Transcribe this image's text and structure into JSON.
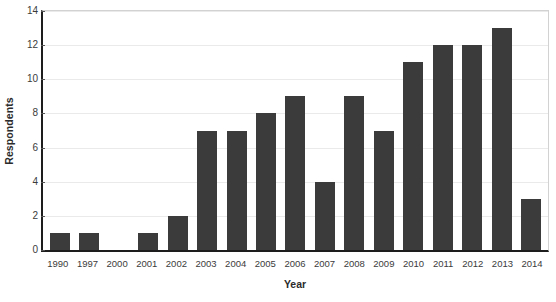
{
  "chart_data": {
    "type": "bar",
    "title": "",
    "xlabel": "Year",
    "ylabel": "Respondents",
    "categories": [
      "1990",
      "1997",
      "2000",
      "2001",
      "2002",
      "2003",
      "2004",
      "2005",
      "2006",
      "2007",
      "2008",
      "2009",
      "2010",
      "2011",
      "2012",
      "2013",
      "2014"
    ],
    "values": [
      1,
      1,
      0,
      1,
      2,
      7,
      7,
      8,
      9,
      4,
      9,
      7,
      11,
      12,
      12,
      13,
      3
    ],
    "ylim": [
      0,
      14
    ],
    "yticks": [
      0,
      2,
      4,
      6,
      8,
      10,
      12,
      14
    ],
    "ytick_labels": [
      "0",
      "2",
      "4",
      "6",
      "8",
      "10",
      "12",
      "14"
    ],
    "grid": "horizontal",
    "legend": "none",
    "bar_color": "#3b3b3b",
    "gridline_color": "#eaeaea",
    "axis_color": "#1d1d1d",
    "background_color": "#ffffff"
  }
}
